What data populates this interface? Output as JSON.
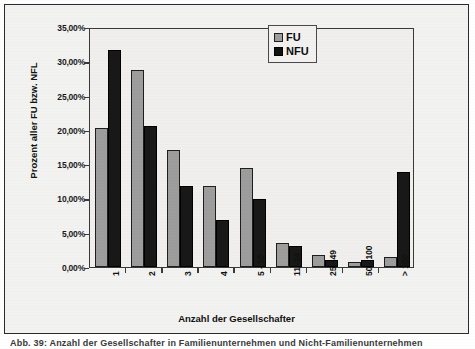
{
  "chart_data": {
    "type": "bar",
    "title": "",
    "xlabel": "Anzahl der Gesellschafter",
    "ylabel": "Prozent aller FU bzw. NFL",
    "categories": [
      "1",
      "2",
      "3",
      "4",
      "5 - 10",
      "11 -24",
      "25 - 49",
      "50 - 100",
      "> 100"
    ],
    "series": [
      {
        "name": "FU",
        "values": [
          20.3,
          28.7,
          17.0,
          11.8,
          14.4,
          3.5,
          1.7,
          0.8,
          1.4
        ]
      },
      {
        "name": "NFU",
        "values": [
          31.7,
          20.5,
          11.8,
          6.9,
          9.9,
          3.1,
          1.0,
          1.0,
          13.9
        ]
      }
    ],
    "ylim": [
      0,
      35
    ],
    "ytick_values": [
      0,
      5,
      10,
      15,
      20,
      25,
      30,
      35
    ],
    "ytick_labels": [
      "0,00%",
      "5,00%",
      "10,00%",
      "15,00%",
      "20,00%",
      "25,00%",
      "30,00%",
      "35,00%"
    ],
    "grid": false,
    "legend_position": "top-right",
    "colors": {
      "FU": "#9d9d9d",
      "NFU": "#181818",
      "axis": "#3a3a3a",
      "background": "#f0efed"
    }
  },
  "legend": {
    "entries": [
      {
        "label": "FU",
        "swatch": "legend-swatch-fu"
      },
      {
        "label": "NFU",
        "swatch": "legend-swatch-nfu"
      }
    ]
  },
  "caption": {
    "text": "Abb. 39: Anzahl der Gesellschafter in Familienunternehmen und Nicht-Familienunternehmen"
  }
}
